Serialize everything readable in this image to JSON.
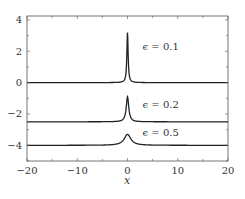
{
  "chart_data": {
    "type": "line",
    "title": "",
    "xlabel": "x",
    "ylabel": "",
    "xlim": [
      -20,
      20
    ],
    "ylim": [
      -5,
      4.25
    ],
    "xticks": [
      -20,
      -10,
      0,
      10,
      20
    ],
    "xtick_labels": [
      "−20",
      "−10",
      "0",
      "10",
      "20"
    ],
    "yticks": [
      4,
      2,
      0,
      -2,
      -4
    ],
    "ytick_labels": [
      "4",
      "2",
      "0",
      "−2",
      "−4"
    ],
    "grid": false,
    "legend": null,
    "series": [
      {
        "name": "ϵ = 0.1",
        "baseline": 0,
        "peak": 3.2,
        "peak_x": 0,
        "width": 0.15
      },
      {
        "name": "ϵ = 0.2",
        "baseline": -2.5,
        "peak": -0.9,
        "peak_x": 0,
        "width": 0.3
      },
      {
        "name": "ϵ = 0.5",
        "baseline": -4,
        "peak": -3.3,
        "peak_x": 0,
        "width": 0.8
      }
    ],
    "annotations": [
      {
        "text": "ϵ = 0.1",
        "x": 3,
        "y": 2.1
      },
      {
        "text": "ϵ = 0.2",
        "x": 3,
        "y": -1.6
      },
      {
        "text": "ϵ = 0.5",
        "x": 3,
        "y": -3.4
      }
    ],
    "colors": {
      "line": "#222222",
      "frame": "#555555",
      "text": "#333333"
    }
  }
}
